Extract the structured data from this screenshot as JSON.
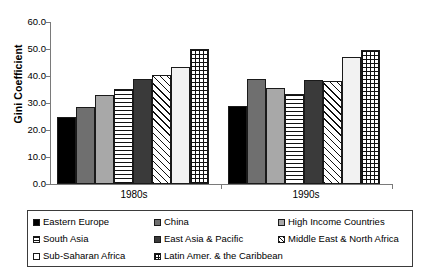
{
  "chart_data": {
    "type": "bar",
    "title": "",
    "xlabel": "",
    "ylabel": "Gini Coefficient",
    "categories": [
      "1980s",
      "1990s"
    ],
    "ylim": [
      0.0,
      60.0
    ],
    "yticks": [
      "0.0",
      "10.0",
      "20.0",
      "30.0",
      "40.0",
      "50.0",
      "60.0"
    ],
    "grid": false,
    "legend_position": "bottom",
    "series": [
      {
        "name": "Eastern Europe",
        "pattern": "solid-black",
        "values": [
          25.0,
          29.0
        ]
      },
      {
        "name": "China",
        "pattern": "solid-dkgray",
        "values": [
          28.7,
          38.8
        ]
      },
      {
        "name": "High Income Countries",
        "pattern": "solid-ltgray",
        "values": [
          33.1,
          35.5
        ]
      },
      {
        "name": "South Asia",
        "pattern": "hlines",
        "values": [
          35.2,
          33.5
        ]
      },
      {
        "name": "East Asia & Pacific",
        "pattern": "solid-dark2",
        "values": [
          38.9,
          38.4
        ]
      },
      {
        "name": "Middle East & North Africa",
        "pattern": "diag",
        "values": [
          40.5,
          38.3
        ]
      },
      {
        "name": "Sub-Saharan Africa",
        "pattern": "solid-white",
        "values": [
          43.5,
          47.0
        ]
      },
      {
        "name": "Latin Amer. & the Caribbean",
        "pattern": "grid",
        "values": [
          49.9,
          49.8
        ]
      }
    ]
  },
  "axis": {
    "y_label": "Gini Coefficient",
    "y_ticks": [
      "60.0",
      "50.0",
      "40.0",
      "30.0",
      "20.0",
      "10.0",
      "0.0"
    ],
    "x_ticks": [
      "1980s",
      "1990s"
    ]
  },
  "legend": {
    "column1": [
      {
        "label": "Eastern Europe",
        "pattern": "solid-black"
      },
      {
        "label": "South Asia",
        "pattern": "hlines"
      },
      {
        "label": "Sub-Saharan Africa",
        "pattern": "solid-white"
      }
    ],
    "column2": [
      {
        "label": "China",
        "pattern": "solid-dkgray"
      },
      {
        "label": "East Asia & Pacific",
        "pattern": "solid-dark2"
      },
      {
        "label": "Latin Amer. & the Caribbean",
        "pattern": "grid"
      }
    ],
    "column3": [
      {
        "label": "High Income Countries",
        "pattern": "solid-ltgray"
      },
      {
        "label": "Middle East & North Africa",
        "pattern": "diag"
      }
    ]
  }
}
